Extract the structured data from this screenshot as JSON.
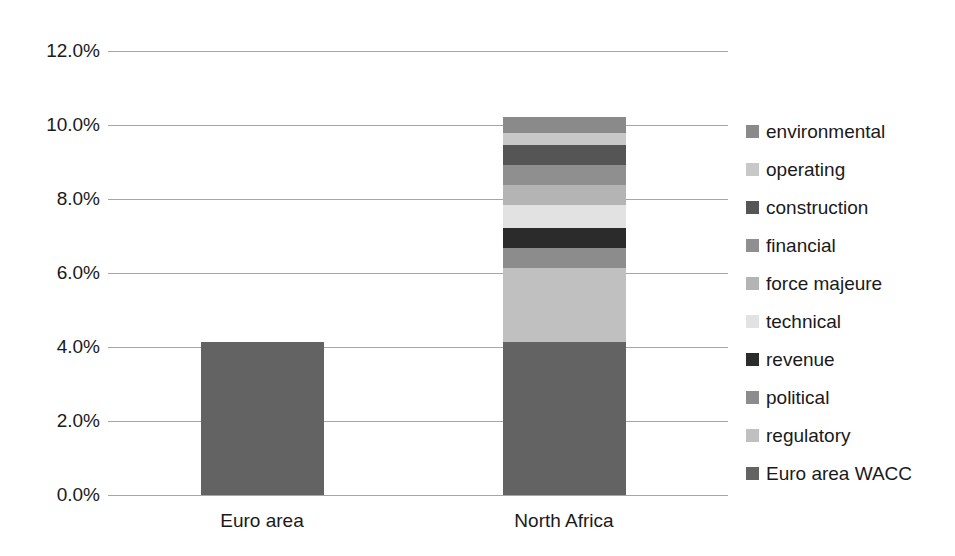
{
  "chart_data": {
    "type": "bar",
    "subtype": "stacked-bar",
    "title": "",
    "subtitle": "",
    "xlabel": "",
    "ylabel": "",
    "categories": [
      "Euro area",
      "North Africa"
    ],
    "ylim": [
      0,
      12
    ],
    "y_tick_values": [
      12.0,
      10.0,
      8.0,
      6.0,
      4.0,
      2.0,
      0.0
    ],
    "y_tick_labels": [
      "12.0%",
      "10.0%",
      "8.0%",
      "6.0%",
      "4.0%",
      "2.0%",
      "0.0%"
    ],
    "y_unit": "%",
    "grid": true,
    "grid_axis": "y",
    "legend_position": "right",
    "legend_order_top_to_bottom": [
      "environmental",
      "operating",
      "construction",
      "financial",
      "force majeure",
      "technical",
      "revenue",
      "political",
      "regulatory",
      "Euro area WACC"
    ],
    "series": [
      {
        "name": "Euro area WACC",
        "color": "#636363",
        "values": [
          4.14,
          4.14
        ]
      },
      {
        "name": "regulatory",
        "color": "#c0c0c0",
        "values": [
          0,
          2.0
        ]
      },
      {
        "name": "political",
        "color": "#8c8c8c",
        "values": [
          0,
          0.54
        ]
      },
      {
        "name": "revenue",
        "color": "#2b2b2b",
        "values": [
          0,
          0.54
        ]
      },
      {
        "name": "technical",
        "color": "#e2e2e2",
        "values": [
          0,
          0.62
        ]
      },
      {
        "name": "force majeure",
        "color": "#b4b4b4",
        "values": [
          0,
          0.54
        ]
      },
      {
        "name": "financial",
        "color": "#8f8f8f",
        "values": [
          0,
          0.54
        ]
      },
      {
        "name": "construction",
        "color": "#555555",
        "values": [
          0,
          0.54
        ]
      },
      {
        "name": "operating",
        "color": "#c8c8c8",
        "values": [
          0,
          0.32
        ]
      },
      {
        "name": "environmental",
        "color": "#8a8a8a",
        "values": [
          0,
          0.44
        ]
      }
    ],
    "totals": [
      4.14,
      10.22
    ],
    "annotations": []
  },
  "axes": {
    "y_ticks": [
      {
        "label": "12.0%",
        "value": 12.0
      },
      {
        "label": "10.0%",
        "value": 10.0
      },
      {
        "label": "8.0%",
        "value": 8.0
      },
      {
        "label": "6.0%",
        "value": 6.0
      },
      {
        "label": "4.0%",
        "value": 4.0
      },
      {
        "label": "2.0%",
        "value": 2.0
      },
      {
        "label": "0.0%",
        "value": 0.0
      }
    ],
    "x_ticks": [
      {
        "label": "Euro area"
      },
      {
        "label": "North Africa"
      }
    ]
  },
  "legend": {
    "items": [
      {
        "label": "environmental",
        "color": "#8a8a8a"
      },
      {
        "label": "operating",
        "color": "#c8c8c8"
      },
      {
        "label": "construction",
        "color": "#555555"
      },
      {
        "label": "financial",
        "color": "#8f8f8f"
      },
      {
        "label": "force majeure",
        "color": "#b4b4b4"
      },
      {
        "label": "technical",
        "color": "#e2e2e2"
      },
      {
        "label": "revenue",
        "color": "#2b2b2b"
      },
      {
        "label": "political",
        "color": "#8c8c8c"
      },
      {
        "label": "regulatory",
        "color": "#c0c0c0"
      },
      {
        "label": "Euro area WACC",
        "color": "#636363"
      }
    ]
  },
  "style": {
    "gridline_color": "#a6a6a6",
    "text_color": "#1a1a1a",
    "background": "#ffffff"
  }
}
